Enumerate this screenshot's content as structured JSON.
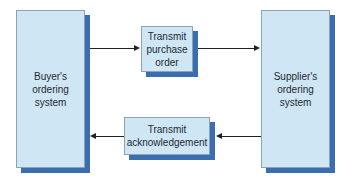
{
  "diagram": {
    "nodes": [
      {
        "id": "buyer",
        "label": "Buyer's\nordering\nsystem"
      },
      {
        "id": "transmit_po",
        "label": "Transmit\npurchase\norder"
      },
      {
        "id": "supplier",
        "label": "Supplier's\nordering\nsystem"
      },
      {
        "id": "transmit_ack",
        "label": "Transmit\nacknowledgement"
      }
    ],
    "edges": [
      {
        "from": "buyer",
        "to": "transmit_po"
      },
      {
        "from": "transmit_po",
        "to": "supplier"
      },
      {
        "from": "supplier",
        "to": "transmit_ack"
      },
      {
        "from": "transmit_ack",
        "to": "buyer"
      }
    ],
    "colors": {
      "box_fill": "#cfe6f5",
      "box_shadow": "#3b6db3",
      "arrow": "#222222"
    }
  }
}
